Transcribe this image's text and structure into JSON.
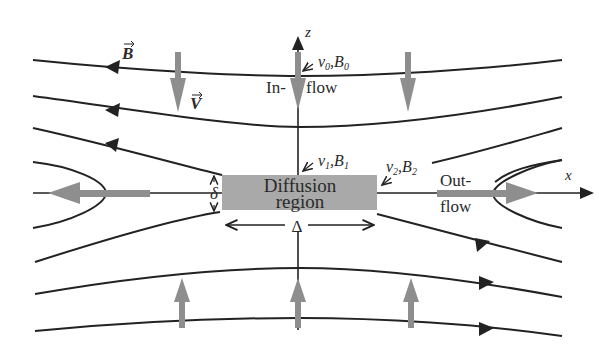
{
  "diagram": {
    "type": "magnetic-reconnection-sweet-parker",
    "labels": {
      "b_vector": "B",
      "v_vector": "V",
      "z_axis": "z",
      "x_axis": "x",
      "inflow_line1": "In-",
      "inflow_line2": "flow",
      "outflow_line1": "Out-",
      "outflow_line2": "flow",
      "v0": "v",
      "v0_sub": "0",
      "b0": "B",
      "b0_sub": "0",
      "v1": "v",
      "v1_sub": "1",
      "b1": "B",
      "b1_sub": "1",
      "v2": "v",
      "v2_sub": "2",
      "b2": "B",
      "b2_sub": "2",
      "comma": ",",
      "diffusion_line1": "Diffusion",
      "diffusion_line2": "region",
      "delta_thickness": "δ",
      "delta_length": "Δ"
    },
    "colors": {
      "field_line": "#222222",
      "flow_arrow": "#8e8e8e",
      "diffusion_region": "#a9a9a9",
      "background": "#ffffff"
    }
  }
}
